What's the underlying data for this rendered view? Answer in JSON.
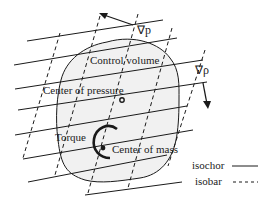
{
  "diagram": {
    "labels": {
      "control_volume": "Control volume",
      "center_of_pressure": "Center of pressure",
      "torque": "Torque",
      "center_of_mass": "Center of mass",
      "grad_p": "∇p",
      "grad_rho": "∇ρ"
    },
    "legend": {
      "isochor": "isochor",
      "isobar": "isobar"
    },
    "colors": {
      "line": "#1a1a1a",
      "fill": "#f1f1f1"
    }
  }
}
